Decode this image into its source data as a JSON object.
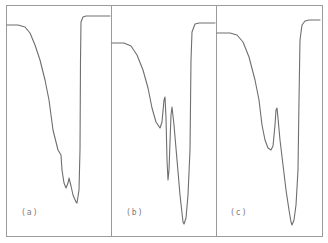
{
  "chart_data": [
    {
      "type": "line",
      "panel": "a",
      "label": "(a)",
      "title": "",
      "xlabel": "",
      "ylabel": "",
      "grid": false,
      "description": "Single trace: flat baseline, gradual descent with shoulder, two minima, then sharp rise back to upper baseline",
      "points_px": [
        [
          7,
          25
        ],
        [
          18,
          25
        ],
        [
          25,
          27
        ],
        [
          30,
          33
        ],
        [
          35,
          45
        ],
        [
          40,
          60
        ],
        [
          45,
          80
        ],
        [
          49,
          100
        ],
        [
          53,
          130
        ],
        [
          56,
          142
        ],
        [
          58,
          150
        ],
        [
          61,
          155
        ],
        [
          62,
          170
        ],
        [
          64,
          183
        ],
        [
          66,
          188
        ],
        [
          68,
          183
        ],
        [
          69,
          178
        ],
        [
          71,
          186
        ],
        [
          73,
          195
        ],
        [
          76,
          202
        ],
        [
          77,
          203
        ],
        [
          79,
          190
        ],
        [
          80,
          150
        ],
        [
          80.5,
          60
        ],
        [
          81,
          22
        ],
        [
          83,
          17
        ],
        [
          86,
          16
        ],
        [
          110,
          16
        ]
      ],
      "features": {
        "baseline_start_y": 25,
        "shoulder_y": 150,
        "minimum_1_y": 188,
        "minimum_2_y": 203,
        "end_baseline_y": 16
      }
    },
    {
      "type": "line",
      "panel": "b",
      "label": "(b)",
      "title": "",
      "xlabel": "",
      "ylabel": "",
      "grid": false,
      "description": "Single trace: flat baseline, descent, three minima separated by two sharp peaks, sharp rise",
      "points_px": [
        [
          112,
          43
        ],
        [
          124,
          43
        ],
        [
          131,
          46
        ],
        [
          137,
          55
        ],
        [
          143,
          70
        ],
        [
          148,
          88
        ],
        [
          152,
          108
        ],
        [
          156,
          122
        ],
        [
          160,
          128
        ],
        [
          162,
          122
        ],
        [
          164,
          100
        ],
        [
          165,
          97
        ],
        [
          166,
          118
        ],
        [
          167,
          160
        ],
        [
          168,
          180
        ],
        [
          169,
          170
        ],
        [
          171,
          115
        ],
        [
          172,
          107
        ],
        [
          174,
          125
        ],
        [
          177,
          160
        ],
        [
          180,
          195
        ],
        [
          183,
          222
        ],
        [
          184,
          224
        ],
        [
          186,
          218
        ],
        [
          188,
          195
        ],
        [
          190,
          150
        ],
        [
          191,
          60
        ],
        [
          192,
          32
        ],
        [
          195,
          24
        ],
        [
          199,
          23
        ],
        [
          215,
          23
        ]
      ],
      "features": {
        "baseline_start_y": 43,
        "minimum_1_y": 128,
        "peak_1_y": 97,
        "minimum_2_y": 180,
        "peak_2_y": 107,
        "minimum_3_y": 224,
        "end_baseline_y": 23
      }
    },
    {
      "type": "line",
      "panel": "c",
      "label": "(c)",
      "title": "",
      "xlabel": "",
      "ylabel": "",
      "grid": false,
      "description": "Single trace: flat baseline, descent, one minimum, one sharp peak, deep minimum, sharp rise",
      "points_px": [
        [
          217,
          33
        ],
        [
          230,
          33
        ],
        [
          237,
          35
        ],
        [
          243,
          42
        ],
        [
          249,
          57
        ],
        [
          255,
          80
        ],
        [
          259,
          100
        ],
        [
          262,
          125
        ],
        [
          265,
          140
        ],
        [
          268,
          148
        ],
        [
          271,
          150
        ],
        [
          273,
          146
        ],
        [
          275,
          125
        ],
        [
          276,
          110
        ],
        [
          277,
          108
        ],
        [
          278,
          118
        ],
        [
          280,
          140
        ],
        [
          283,
          165
        ],
        [
          286,
          190
        ],
        [
          289,
          210
        ],
        [
          291,
          222
        ],
        [
          292,
          225
        ],
        [
          294,
          220
        ],
        [
          296,
          205
        ],
        [
          298,
          170
        ],
        [
          299,
          100
        ],
        [
          300,
          40
        ],
        [
          302,
          25
        ],
        [
          305,
          21
        ],
        [
          309,
          20
        ],
        [
          320,
          20
        ]
      ],
      "features": {
        "baseline_start_y": 33,
        "minimum_1_y": 150,
        "peak_1_y": 108,
        "minimum_2_y": 225,
        "end_baseline_y": 20
      }
    }
  ],
  "figure": {
    "frame": {
      "left": 6.5,
      "top": 5.5,
      "right": 322.5,
      "bottom": 236.5
    },
    "dividers_x": [
      111.5,
      216.5
    ],
    "colors": {
      "frame": "#9a9a9a",
      "trace": "#6e6e6e",
      "label": "#7a7a7a",
      "background": "#ffffff"
    }
  },
  "labels": {
    "a": "(a)",
    "b": "(b)",
    "c": "(c)"
  }
}
